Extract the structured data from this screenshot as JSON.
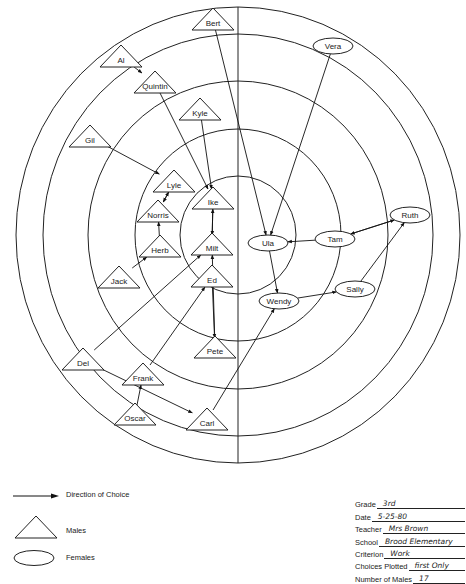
{
  "chart_data": {
    "type": "sociogram",
    "title": "",
    "center": [
      238,
      235
    ],
    "rings": [
      {
        "rx": 222,
        "ry": 228
      },
      {
        "rx": 195,
        "ry": 201
      },
      {
        "rx": 150,
        "ry": 154
      },
      {
        "rx": 103,
        "ry": 106
      },
      {
        "rx": 58,
        "ry": 59
      }
    ],
    "divider_x": 238,
    "males": [
      {
        "id": "Bert",
        "label": "Bert",
        "x": 213,
        "y": 20
      },
      {
        "id": "Al",
        "label": "Al",
        "x": 121,
        "y": 57
      },
      {
        "id": "Quintin",
        "label": "Quintin",
        "x": 155,
        "y": 83
      },
      {
        "id": "Kyle",
        "label": "Kyle",
        "x": 200,
        "y": 110
      },
      {
        "id": "Gil",
        "label": "Gil",
        "x": 90,
        "y": 137
      },
      {
        "id": "Lyle",
        "label": "Lyle",
        "x": 174,
        "y": 182
      },
      {
        "id": "Ike",
        "label": "Ike",
        "x": 213,
        "y": 199
      },
      {
        "id": "Norris",
        "label": "Norris",
        "x": 158,
        "y": 212
      },
      {
        "id": "Herb",
        "label": "Herb",
        "x": 160,
        "y": 247
      },
      {
        "id": "Milt",
        "label": "Milt",
        "x": 212,
        "y": 245
      },
      {
        "id": "Jack",
        "label": "Jack",
        "x": 119,
        "y": 278
      },
      {
        "id": "Ed",
        "label": "Ed",
        "x": 212,
        "y": 277
      },
      {
        "id": "Pete",
        "label": "Pete",
        "x": 215,
        "y": 348
      },
      {
        "id": "Del",
        "label": "Del",
        "x": 83,
        "y": 360
      },
      {
        "id": "Frank",
        "label": "Frank",
        "x": 143,
        "y": 375
      },
      {
        "id": "Oscar",
        "label": "Oscar",
        "x": 135,
        "y": 415
      },
      {
        "id": "Carl",
        "label": "Carl",
        "x": 207,
        "y": 420
      }
    ],
    "females": [
      {
        "id": "Vera",
        "label": "Vera",
        "x": 333,
        "y": 46
      },
      {
        "id": "Ruth",
        "label": "Ruth",
        "x": 410,
        "y": 215
      },
      {
        "id": "Tam",
        "label": "Tam",
        "x": 335,
        "y": 239
      },
      {
        "id": "Ula",
        "label": "Ula",
        "x": 268,
        "y": 243
      },
      {
        "id": "Sally",
        "label": "Sally",
        "x": 355,
        "y": 289
      },
      {
        "id": "Wendy",
        "label": "Wendy",
        "x": 279,
        "y": 301
      }
    ],
    "choices": [
      {
        "from": "Al",
        "to": "Quintin"
      },
      {
        "from": "Quintin",
        "to": "Ike"
      },
      {
        "from": "Kyle",
        "to": "Ike"
      },
      {
        "from": "Gil",
        "to": "Lyle"
      },
      {
        "from": "Lyle",
        "to": "Norris"
      },
      {
        "from": "Norris",
        "to": "Lyle"
      },
      {
        "from": "Herb",
        "to": "Norris"
      },
      {
        "from": "Jack",
        "to": "Herb"
      },
      {
        "from": "Milt",
        "to": "Ike"
      },
      {
        "from": "Ike",
        "to": "Milt"
      },
      {
        "from": "Del",
        "to": "Milt"
      },
      {
        "from": "Frank",
        "to": "Ed"
      },
      {
        "from": "Oscar",
        "to": "Frank"
      },
      {
        "from": "Del",
        "to": "Carl"
      },
      {
        "from": "Ed",
        "to": "Pete"
      },
      {
        "from": "Pete",
        "to": "Milt"
      },
      {
        "from": "Bert",
        "to": "Ula"
      },
      {
        "from": "Vera",
        "to": "Ula"
      },
      {
        "from": "Tam",
        "to": "Ula"
      },
      {
        "from": "Ruth",
        "to": "Tam"
      },
      {
        "from": "Tam",
        "to": "Ruth"
      },
      {
        "from": "Ula",
        "to": "Wendy"
      },
      {
        "from": "Wendy",
        "to": "Sally"
      },
      {
        "from": "Sally",
        "to": "Ruth"
      },
      {
        "from": "Carl",
        "to": "Wendy"
      }
    ]
  },
  "legend": {
    "direction_label": "Direction of Choice",
    "males_label": "Males",
    "females_label": "Females"
  },
  "info": [
    {
      "key": "Grade",
      "value": "3rd"
    },
    {
      "key": "Date",
      "value": "5-25-80"
    },
    {
      "key": "Teacher",
      "value": "Mrs Brown"
    },
    {
      "key": "School",
      "value": "Brood Elementary"
    },
    {
      "key": "Criterion",
      "value": "Work"
    },
    {
      "key": "Choices Plotted",
      "value": "first Only"
    },
    {
      "key": "Number of Males",
      "value": "17"
    }
  ]
}
